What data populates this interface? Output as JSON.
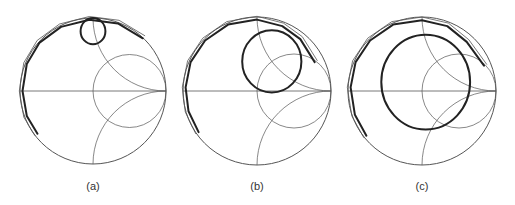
{
  "figure": {
    "panels": [
      {
        "label": "(a)",
        "center": [
          93,
          91
        ],
        "radius": 73,
        "trajectory_outer": [
          [
            -0.78,
            -0.6
          ],
          [
            -0.93,
            -0.35
          ],
          [
            -0.99,
            0.0
          ],
          [
            -0.93,
            0.38
          ],
          [
            -0.75,
            0.68
          ],
          [
            -0.45,
            0.9
          ],
          [
            -0.05,
            1.0
          ],
          [
            0.35,
            0.95
          ],
          [
            0.7,
            0.74
          ]
        ],
        "loop": {
          "cx": 0.0,
          "cy": 0.82,
          "rx": 0.17,
          "ry": 0.18
        }
      },
      {
        "label": "(b)",
        "center": [
          257,
          91
        ],
        "radius": 74,
        "trajectory_outer": [
          [
            -0.81,
            -0.57
          ],
          [
            -0.95,
            -0.28
          ],
          [
            -0.99,
            0.05
          ],
          [
            -0.92,
            0.4
          ],
          [
            -0.72,
            0.7
          ],
          [
            -0.4,
            0.92
          ],
          [
            0.0,
            0.99
          ],
          [
            0.35,
            0.9
          ],
          [
            0.6,
            0.72
          ],
          [
            0.8,
            0.4
          ]
        ],
        "loop": {
          "cx": 0.2,
          "cy": 0.4,
          "rx": 0.4,
          "ry": 0.42
        }
      },
      {
        "label": "(c)",
        "center": [
          422,
          91
        ],
        "radius": 74,
        "trajectory_outer": [
          [
            -0.77,
            -0.62
          ],
          [
            -0.93,
            -0.33
          ],
          [
            -0.99,
            0.05
          ],
          [
            -0.92,
            0.4
          ],
          [
            -0.72,
            0.7
          ],
          [
            -0.4,
            0.92
          ],
          [
            0.0,
            0.98
          ],
          [
            0.35,
            0.9
          ],
          [
            0.62,
            0.68
          ],
          [
            0.86,
            0.35
          ]
        ],
        "loop": {
          "cx": 0.05,
          "cy": 0.12,
          "rx": 0.6,
          "ry": 0.64
        }
      }
    ],
    "grid_color": "#555555",
    "trace_color": "#222222"
  }
}
